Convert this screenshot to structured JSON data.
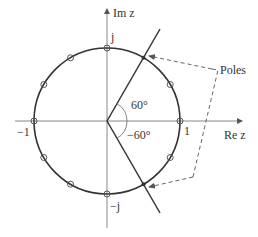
{
  "diagram": {
    "axes": {
      "real_label": "Re z",
      "imag_label": "Im z"
    },
    "ticks": {
      "pos_real": "1",
      "neg_real": "−1",
      "pos_imag": "j",
      "neg_imag": "−j"
    },
    "angles": {
      "upper": "60°",
      "lower": "−60°"
    },
    "annotation": {
      "poles_label": "Poles"
    },
    "unit_circle_zeros_deg": [
      0,
      30,
      90,
      120,
      150,
      180,
      210,
      240,
      270,
      330
    ],
    "poles_deg": [
      60,
      -60
    ],
    "colors": {
      "stroke": "#333333",
      "axis": "#777777",
      "dash": "#666666"
    }
  }
}
